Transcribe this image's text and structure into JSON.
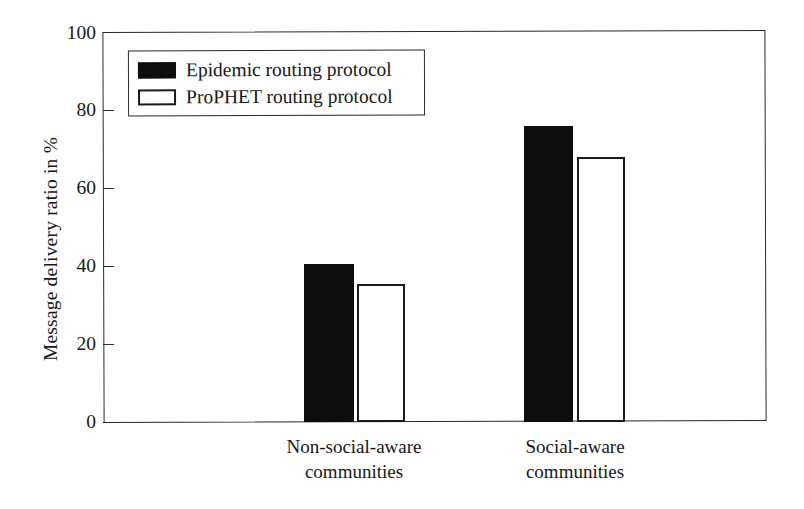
{
  "chart_data": {
    "type": "bar",
    "title": "",
    "xlabel": "",
    "ylabel": "Message delivery ratio in %",
    "ylim": [
      0,
      100
    ],
    "yticks": [
      0,
      20,
      40,
      60,
      80,
      100
    ],
    "grid": false,
    "legend_position": "upper left",
    "categories": [
      "Non-social-aware communities",
      "Social-aware communities"
    ],
    "category_lines": [
      [
        "Non-social-aware",
        "communities"
      ],
      [
        "Social-aware",
        "communities"
      ]
    ],
    "series": [
      {
        "name": "Epidemic routing protocol",
        "values": [
          40.5,
          76
        ],
        "color": "#0d0d0d",
        "style": "filled"
      },
      {
        "name": "ProPHET routing protocol",
        "values": [
          35.5,
          68
        ],
        "color": "#ffffff",
        "style": "hollow"
      }
    ]
  },
  "axis": {
    "y_title": "Message delivery ratio in %",
    "y_tick_labels": [
      "0",
      "20",
      "40",
      "60",
      "80",
      "100"
    ]
  },
  "legend": {
    "items": [
      {
        "label": "Epidemic routing protocol",
        "swatch": "filled-black-rect"
      },
      {
        "label": "ProPHET routing protocol",
        "swatch": "hollow-white-rect"
      }
    ]
  }
}
